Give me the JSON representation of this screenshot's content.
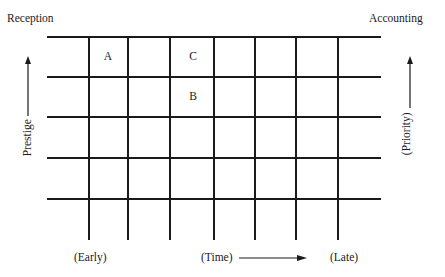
{
  "diagram": {
    "corner_labels": {
      "top_left": "Reception",
      "top_right": "Accounting"
    },
    "left_axis": {
      "label": "Prestige",
      "direction": "up"
    },
    "right_axis": {
      "label": "(Priority)",
      "direction": "up"
    },
    "bottom_axis": {
      "start_label": "(Early)",
      "middle_label": "(Time)",
      "end_label": "(Late)",
      "direction": "right"
    },
    "grid": {
      "rows": 5,
      "columns": 7,
      "horizontal_lines_y": [
        37,
        77,
        117,
        158,
        199
      ],
      "vertical_lines_x": [
        89,
        128,
        170,
        214,
        255,
        296,
        338
      ],
      "line_color": "#1a1a1a"
    },
    "cell_markers": [
      {
        "label": "A",
        "x": 108,
        "y": 57
      },
      {
        "label": "C",
        "x": 192,
        "y": 57
      },
      {
        "label": "B",
        "x": 192,
        "y": 97
      }
    ]
  }
}
